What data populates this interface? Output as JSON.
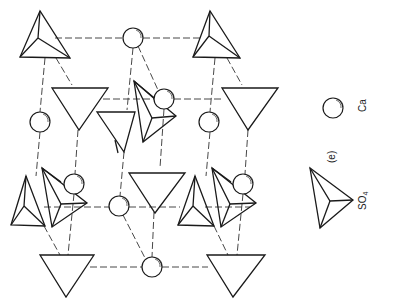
{
  "figure": {
    "panel_label": "(e)",
    "colors": {
      "line": "#1a1a1a",
      "background": "#ffffff"
    }
  },
  "legend": {
    "items": [
      {
        "symbol": "sphere",
        "label": "Ca"
      },
      {
        "symbol": "tetrahedron",
        "label": "SO4",
        "label_main": "SO",
        "label_sub": "4"
      }
    ]
  },
  "structure": {
    "ca_ions": [
      {
        "cx": 133,
        "cy": 38
      },
      {
        "cx": 164,
        "cy": 99
      },
      {
        "cx": 40,
        "cy": 122
      },
      {
        "cx": 209,
        "cy": 122
      },
      {
        "cx": 74,
        "cy": 184
      },
      {
        "cx": 243,
        "cy": 184
      },
      {
        "cx": 119,
        "cy": 206
      },
      {
        "cx": 152,
        "cy": 267
      }
    ],
    "so4_tetrahedra_count": 14
  }
}
